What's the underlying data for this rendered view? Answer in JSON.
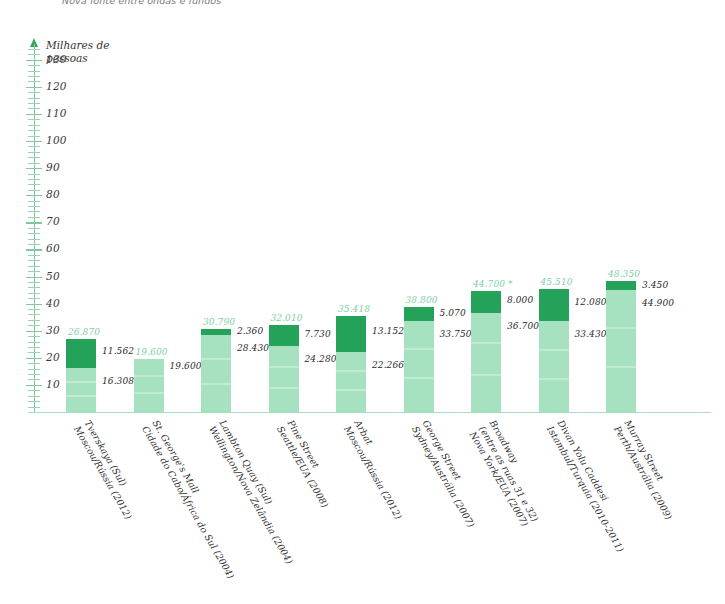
{
  "top_note": "Nova fonte entre ondas e fundos",
  "axis": {
    "y_title_line1": "Milhares de",
    "y_title_line2": "pessoas",
    "y_ticks": [
      "130",
      "120",
      "110",
      "100",
      "90",
      "80",
      "70",
      "60",
      "50",
      "40",
      "30",
      "20",
      "10"
    ]
  },
  "chart_data": {
    "type": "bar",
    "title": "",
    "subtitle": "",
    "xlabel": "",
    "ylabel": "Milhares de pessoas",
    "ylim": [
      0,
      135
    ],
    "grid": false,
    "legend_position": "none",
    "stacked": true,
    "units": "milhares de pessoas",
    "categories": [
      "Tverskaya (Sul)\nMoscou/Rússia (2012)",
      "St. George's Mall\nCidade do Cabo/África do Sul (2004)",
      "Lambton Quay (Sul)\nWellington/Nova Zelândia (2004)",
      "Pine Street\nSeattle/EUA (2008)",
      "Arbat\nMoscou/Rússia (2012)",
      "George Street\nSydney/Austrália (2007)",
      "Broadway\n(entre as ruas 31 e 32)\nNova York/EUA (2007)",
      "Divan Yolu Caddesi\nIstambul/Turquia (2010-2011)",
      "Murray Street\nPerth/Austrália (2009)"
    ],
    "series": [
      {
        "name": "segmento inferior",
        "values": [
          16308,
          19600,
          28430,
          24280,
          22266,
          33750,
          36700,
          33430,
          44900
        ],
        "color": "#a6e2bf"
      },
      {
        "name": "segmento superior",
        "values": [
          11562,
          0,
          2360,
          7730,
          13152,
          5070,
          8000,
          12080,
          3450
        ],
        "color": "#25a25a"
      }
    ],
    "totals": [
      26870,
      19600,
      30790,
      32010,
      35418,
      38800,
      44700,
      45510,
      48350
    ],
    "bars": [
      {
        "name": "Tverskaya (Sul)",
        "city_country_year": "Moscou/Rússia (2012)",
        "label_lines": [
          "Tverskaya (Sul)",
          "Moscou/Rússia (2012)"
        ],
        "total_label": "26.870",
        "upper_label": "11.562",
        "lower_label": "16.308",
        "total": 26870,
        "upper": 11562,
        "lower": 16308,
        "asterisk": ""
      },
      {
        "name": "St. George's Mall",
        "city_country_year": "Cidade do Cabo/África do Sul (2004)",
        "label_lines": [
          "St. George's Mall",
          "Cidade do Cabo/África do Sul (2004)"
        ],
        "total_label": "19.600",
        "upper_label": "",
        "lower_label": "19.600",
        "total": 19600,
        "upper": 0,
        "lower": 19600,
        "asterisk": ""
      },
      {
        "name": "Lambton Quay (Sul)",
        "city_country_year": "Wellington/Nova Zelândia (2004)",
        "label_lines": [
          "Lambton Quay (Sul)",
          "Wellington/Nova Zelândia (2004)"
        ],
        "total_label": "30.790",
        "upper_label": "2.360",
        "lower_label": "28.430",
        "total": 30790,
        "upper": 2360,
        "lower": 28430,
        "asterisk": ""
      },
      {
        "name": "Pine Street",
        "city_country_year": "Seattle/EUA (2008)",
        "label_lines": [
          "Pine Street",
          "Seattle/EUA (2008)"
        ],
        "total_label": "32.010",
        "upper_label": "7.730",
        "lower_label": "24.280",
        "total": 32010,
        "upper": 7730,
        "lower": 24280,
        "asterisk": ""
      },
      {
        "name": "Arbat",
        "city_country_year": "Moscou/Rússia (2012)",
        "label_lines": [
          "Arbat",
          "Moscou/Rússia (2012)"
        ],
        "total_label": "35.418",
        "upper_label": "13.152",
        "lower_label": "22.266",
        "total": 35418,
        "upper": 13152,
        "lower": 22266,
        "asterisk": ""
      },
      {
        "name": "George Street",
        "city_country_year": "Sydney/Austrália (2007)",
        "label_lines": [
          "George Street",
          "Sydney/Austrália (2007)"
        ],
        "total_label": "38.800",
        "upper_label": "5.070",
        "lower_label": "33.750",
        "total": 38800,
        "upper": 5070,
        "lower": 33750,
        "asterisk": ""
      },
      {
        "name": "Broadway (entre as ruas 31 e 32)",
        "city_country_year": "Nova York/EUA (2007)",
        "label_lines": [
          "Broadway",
          "(entre as ruas 31 e 32)",
          "Nova York/EUA (2007)"
        ],
        "total_label": "44.700 *",
        "upper_label": "8.000",
        "lower_label": "36.700",
        "total": 44700,
        "upper": 8000,
        "lower": 36700,
        "asterisk": "*"
      },
      {
        "name": "Divan Yolu Caddesi",
        "city_country_year": "Istambul/Turquia (2010-2011)",
        "label_lines": [
          "Divan Yolu Caddesi",
          "Istambul/Turquia (2010-2011)"
        ],
        "total_label": "45.510",
        "upper_label": "12.080",
        "lower_label": "33.430",
        "total": 45510,
        "upper": 12080,
        "lower": 33430,
        "asterisk": ""
      },
      {
        "name": "Murray Street",
        "city_country_year": "Perth/Austrália (2009)",
        "label_lines": [
          "Murray Street",
          "Perth/Austrália (2009)"
        ],
        "total_label": "48.350",
        "upper_label": "3.450",
        "lower_label": "44.900",
        "total": 48350,
        "upper": 3450,
        "lower": 44900,
        "asterisk": ""
      }
    ]
  },
  "colors": {
    "segment_light": "#a6e2bf",
    "segment_dark": "#25a25a",
    "axis": "#7fc9a0",
    "total_label": "#7ecfa2",
    "value_label": "#2b2b2b"
  }
}
